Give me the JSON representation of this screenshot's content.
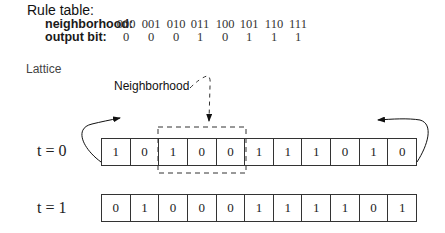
{
  "rule_table": {
    "title": "Rule table:",
    "neighborhood_label": "neighborhood:",
    "output_label": "output bit:",
    "neighborhoods": [
      "000",
      "001",
      "010",
      "011",
      "100",
      "101",
      "110",
      "111"
    ],
    "outputs": [
      "0",
      "0",
      "0",
      "1",
      "0",
      "1",
      "1",
      "1"
    ]
  },
  "lattice": {
    "label": "Lattice",
    "neighborhood_annotation": "Neighborhood",
    "rows": [
      {
        "label": "t = 0",
        "cells": [
          "1",
          "0",
          "1",
          "0",
          "0",
          "1",
          "1",
          "1",
          "0",
          "1",
          "0"
        ]
      },
      {
        "label": "t = 1",
        "cells": [
          "0",
          "1",
          "0",
          "0",
          "0",
          "1",
          "1",
          "1",
          "1",
          "0",
          "1"
        ]
      }
    ],
    "highlighted_neighborhood": {
      "row": 0,
      "start_index": 2,
      "end_index": 4
    }
  }
}
